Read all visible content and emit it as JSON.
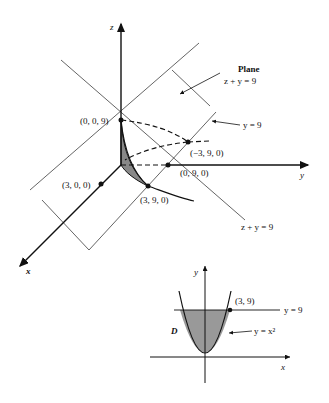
{
  "figure3d": {
    "axes": {
      "x": "x",
      "y": "y",
      "z": "z"
    },
    "points": {
      "p009": "(0, 0, 9)",
      "pm390": "(−3, 9, 0)",
      "p090": "(0, 9, 0)",
      "p300": "(3, 0, 0)",
      "p390": "(3, 9, 0)"
    },
    "labels": {
      "plane_title": "Plane",
      "plane_eq": "z + y = 9",
      "y9": "y = 9",
      "zy9": "z + y = 9"
    }
  },
  "figure2d": {
    "axes": {
      "x": "x",
      "y": "y"
    },
    "region": "D",
    "point": "(3, 9)",
    "line_label": "y = 9",
    "curve_label": "y = x²"
  }
}
